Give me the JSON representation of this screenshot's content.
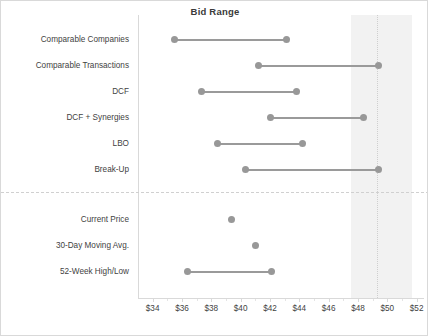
{
  "chart": {
    "title": "Bid Range"
  },
  "chart_data": {
    "type": "bar",
    "subtype": "float-range-dumbbell",
    "title": "Bid Range",
    "xlabel": "",
    "ylabel": "",
    "xlim": [
      33,
      52.5
    ],
    "grid": false,
    "legend": false,
    "axis_tick_labels": [
      "$34",
      "$36",
      "$38",
      "$40",
      "$42",
      "$44",
      "$46",
      "$48",
      "$50",
      "$52"
    ],
    "axis_tick_values": [
      34,
      36,
      38,
      40,
      42,
      44,
      46,
      48,
      50,
      52
    ],
    "axis_tick_step": 2,
    "axis_minor_step": 1,
    "categories": [
      "Comparable Companies",
      "Comparable Transactions",
      "DCF",
      "DCF + Synergies",
      "LBO",
      "Break-Up",
      "",
      "Current Price",
      "30-Day Moving Avg.",
      "52-Week High/Low"
    ],
    "series": [
      {
        "name": "Low",
        "values": [
          35.5,
          41.2,
          37.3,
          42.0,
          38.4,
          40.3,
          null,
          39.4,
          41.0,
          36.4
        ]
      },
      {
        "name": "High",
        "values": [
          43.1,
          49.4,
          43.8,
          48.4,
          44.2,
          49.4,
          null,
          39.4,
          41.0,
          42.1
        ]
      }
    ],
    "rows": [
      {
        "label": "Comparable Companies",
        "low": 35.5,
        "high": 43.1,
        "group": "methodology"
      },
      {
        "label": "Comparable Transactions",
        "low": 41.2,
        "high": 49.4,
        "group": "methodology"
      },
      {
        "label": "DCF",
        "low": 37.3,
        "high": 43.8,
        "group": "methodology"
      },
      {
        "label": "DCF + Synergies",
        "low": 42.0,
        "high": 48.4,
        "group": "methodology"
      },
      {
        "label": "LBO",
        "low": 38.4,
        "high": 44.2,
        "group": "methodology"
      },
      {
        "label": "Break-Up",
        "low": 40.3,
        "high": 49.4,
        "group": "methodology"
      },
      {
        "label": "Current Price",
        "low": 39.4,
        "high": 39.4,
        "group": "market"
      },
      {
        "label": "30-Day Moving Avg.",
        "low": 41.0,
        "high": 41.0,
        "group": "market"
      },
      {
        "label": "52-Week High/Low",
        "low": 36.4,
        "high": 42.1,
        "group": "market"
      }
    ],
    "annotations": {
      "shaded_band": {
        "from": 47.5,
        "to": 51.7
      },
      "reference_line": {
        "value": 49.3
      },
      "group_separator_after_row": "Break-Up"
    },
    "colors": {
      "marker": "#989898",
      "line": "#9a9a9a",
      "shade_band": "#f2f2f2",
      "reference_line": "#cfcfcf",
      "axis": "#d9d9d9",
      "text": "#3f3f3f",
      "title": "#3a3a3a",
      "background": "#ffffff",
      "border": "#d9d9d9"
    }
  }
}
